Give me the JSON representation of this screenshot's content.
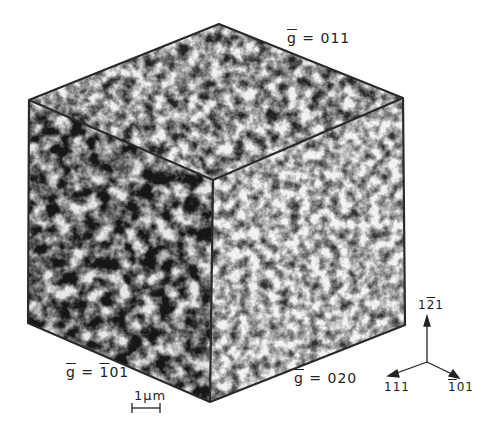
{
  "figure": {
    "faces": {
      "top": {
        "g_label_prefix": "g",
        "g_label_value": "= 011"
      },
      "left": {
        "g_label_prefix": "g",
        "g_label_bar": "1",
        "g_label_value_pre": "= ",
        "g_label_value_post": "01"
      },
      "right": {
        "g_label_prefix": "g",
        "g_label_value": "= 020"
      }
    },
    "scale_bar": {
      "label": "1μm"
    },
    "axes": {
      "up": {
        "pre": "1",
        "bar": "2",
        "post": "1"
      },
      "left": {
        "label": "111"
      },
      "right": {
        "bar": "1",
        "post": "01"
      }
    },
    "colors": {
      "edge": "#2a2a2a",
      "background": "#ffffff",
      "text": "#222222"
    }
  }
}
